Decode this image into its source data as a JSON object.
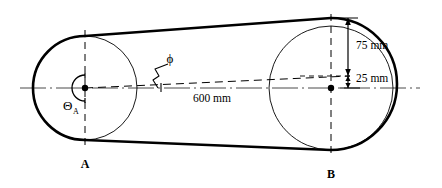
{
  "diagram": {
    "type": "engineering-line-diagram",
    "colors": {
      "stroke": "#000000",
      "background": "#ffffff",
      "centerline": "#555555"
    },
    "labels": {
      "pulley_a": "A",
      "pulley_b": "B",
      "wrap_angle_theta": "Θ",
      "wrap_angle_subscript": "A",
      "belt_angle_phi": "ϕ",
      "center_distance": "600 mm",
      "upper_offset": "75 mm",
      "lower_offset": "25 mm"
    },
    "geometry": {
      "pulley_a_center": [
        85,
        88
      ],
      "pulley_a_radius": 52,
      "pulley_a_hub_radius": 13,
      "pulley_b_center": [
        331,
        88
      ],
      "pulley_b_radius": 62,
      "centerline_y": 88,
      "centerline_x_start": 20,
      "centerline_x_end": 420,
      "slant_line_from": [
        85,
        88
      ],
      "slant_line_to": [
        345,
        76
      ],
      "tangent_upper": [
        [
          85,
          36
        ],
        [
          331,
          18
        ]
      ],
      "tangent_lower": [
        [
          85,
          140
        ],
        [
          331,
          150
        ]
      ],
      "dim_75_top_y": 18,
      "dim_75_bottom_y": 76,
      "dim_25_top_y": 76,
      "dim_25_bottom_y": 88,
      "dim_x": 348
    }
  }
}
